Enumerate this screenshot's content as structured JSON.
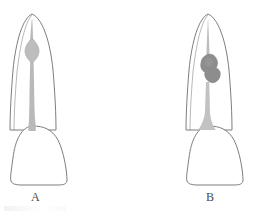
{
  "figure": {
    "title": "",
    "background_color": "#ffffff",
    "width": 257,
    "height": 214,
    "outline_color": "#6e6e6e",
    "pulp_color": "#b9b9b9",
    "lesion_color": "#8d8d8d",
    "label_color": "#4a4a4a"
  },
  "panels": [
    {
      "id": "panel-a",
      "label": "A",
      "description": "tooth-normal-pulp-canal",
      "parts": {
        "root_outline": "root",
        "crown_outline": "crown",
        "pulp_canal": "narrow-canal",
        "pulp_chamber": "lens-shaped-widening"
      }
    },
    {
      "id": "panel-b",
      "label": "B",
      "description": "tooth-with-internal-resorption-lesion",
      "parts": {
        "root_outline": "root",
        "crown_outline": "crown",
        "pulp_canal": "narrow-canal",
        "lesion": "irregular-radiolucent-blob"
      }
    }
  ]
}
